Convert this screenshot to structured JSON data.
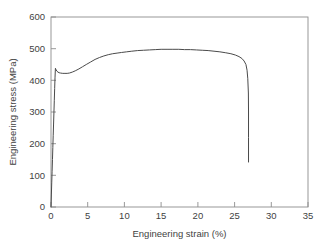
{
  "chart_data": {
    "type": "line",
    "title": "",
    "xlabel": "Engineering strain (%)",
    "ylabel": "Engineering stress (MPa)",
    "xlim": [
      0,
      35
    ],
    "ylim": [
      0,
      600
    ],
    "xticks": [
      0,
      5,
      10,
      15,
      20,
      25,
      30,
      35
    ],
    "yticks": [
      0,
      100,
      200,
      300,
      400,
      500,
      600
    ],
    "xtick_labels": [
      "0",
      "5",
      "10",
      "15",
      "20",
      "25",
      "30",
      "35"
    ],
    "ytick_labels": [
      "0",
      "100",
      "200",
      "300",
      "400",
      "500",
      "600"
    ],
    "grid": false,
    "legend": null,
    "line_color": "#4a4a4a",
    "frame_color": "#8d8d8d",
    "series": [
      {
        "name": "Engineering stress-strain curve",
        "x": [
          0.0,
          0.05,
          0.1,
          0.15,
          0.2,
          0.25,
          0.3,
          0.35,
          0.4,
          0.45,
          0.5,
          0.55,
          0.6,
          0.7,
          0.8,
          0.95,
          1.1,
          1.3,
          1.6,
          1.9,
          2.2,
          2.5,
          2.9,
          3.3,
          3.8,
          4.3,
          4.8,
          5.4,
          6.0,
          6.6,
          7.2,
          7.8,
          8.4,
          9.0,
          9.6,
          10.3,
          11.0,
          11.8,
          12.6,
          13.4,
          14.2,
          15.0,
          15.8,
          16.6,
          17.4,
          18.2,
          19.0,
          19.8,
          20.6,
          21.4,
          22.2,
          23.0,
          23.8,
          24.5,
          25.1,
          25.6,
          26.0,
          26.3,
          26.55,
          26.7,
          26.8,
          26.88,
          26.9,
          26.9,
          26.9
        ],
        "y": [
          0,
          38,
          76,
          113,
          150,
          188,
          225,
          262,
          300,
          337,
          374,
          410,
          438,
          433,
          429,
          426,
          424,
          423,
          422,
          422,
          422,
          423,
          426,
          430,
          436,
          443,
          450,
          458,
          466,
          472,
          477,
          481,
          484,
          486,
          488,
          490,
          492,
          494,
          495,
          496,
          497,
          498,
          498,
          498,
          498,
          497,
          497,
          496,
          495,
          494,
          492,
          490,
          487,
          484,
          480,
          475,
          469,
          461,
          450,
          432,
          405,
          360,
          300,
          220,
          142
        ]
      }
    ],
    "annotations": {
      "yield_peak_mpa": 438,
      "yield_peak_strain_pct": 0.6,
      "lower_yield_mpa": 422,
      "uts_mpa": 498,
      "uts_strain_pct": 16,
      "fracture_strain_pct": 26.9,
      "fracture_stress_mpa": 142
    }
  }
}
